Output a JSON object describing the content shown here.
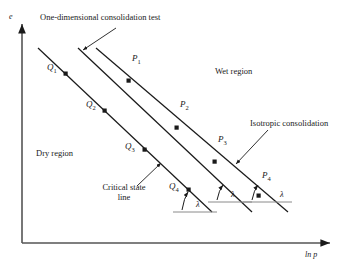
{
  "figure": {
    "type": "technical-diagram",
    "background": "#ffffff",
    "ink": "#1a1a1a"
  },
  "axes": {
    "y_label": "e",
    "x_label": "ln p",
    "origin": [
      22,
      243
    ],
    "y_top": [
      22,
      22
    ],
    "x_right": [
      332,
      243
    ],
    "arrowheads": "both"
  },
  "annotations": {
    "one_dim": "One-dimensional consolidation test",
    "isotropic": "Isotropic consolidation",
    "critical_state_line_1": "Critical state",
    "critical_state_line_2": "line",
    "wet_region": "Wet region",
    "dry_region": "Dry region"
  },
  "slope_symbols": [
    {
      "name": "lambda-1",
      "label": "λ"
    },
    {
      "name": "lambda-2",
      "label": "λ"
    },
    {
      "name": "lambda-3",
      "label": "λ"
    }
  ],
  "lines": [
    {
      "name": "critical-state-line",
      "x1": 38,
      "y1": 48,
      "x2": 212,
      "y2": 212
    },
    {
      "name": "one-dimensional-consolidation-line",
      "x1": 78,
      "y1": 48,
      "x2": 252,
      "y2": 212
    },
    {
      "name": "isotropic-consolidation-line",
      "x1": 96,
      "y1": 48,
      "x2": 288,
      "y2": 212
    }
  ],
  "points": [
    {
      "name": "Q1",
      "label": "Q",
      "sub": "1",
      "x": 66,
      "y": 74,
      "lx": 47,
      "ly": 68
    },
    {
      "name": "Q2",
      "label": "Q",
      "sub": "2",
      "x": 105,
      "y": 111,
      "lx": 86,
      "ly": 105
    },
    {
      "name": "Q3",
      "label": "Q",
      "sub": "3",
      "x": 145,
      "y": 150,
      "lx": 125,
      "ly": 147
    },
    {
      "name": "Q4",
      "label": "Q",
      "sub": "4",
      "x": 189,
      "y": 190,
      "lx": 170,
      "ly": 186
    },
    {
      "name": "P1",
      "label": "P",
      "sub": "1",
      "x": 129,
      "y": 81,
      "lx": 133,
      "ly": 58
    },
    {
      "name": "P2",
      "label": "P",
      "sub": "2",
      "x": 177,
      "y": 128,
      "lx": 181,
      "ly": 104
    },
    {
      "name": "P3",
      "label": "P",
      "sub": "3",
      "x": 215,
      "y": 162,
      "lx": 219,
      "ly": 139
    },
    {
      "name": "P4",
      "label": "P",
      "sub": "4",
      "x": 259,
      "y": 196,
      "lx": 263,
      "ly": 175
    }
  ],
  "lambda_markers": [
    {
      "name": "lambda-marker-left",
      "apex_x": 189,
      "apex_y": 190,
      "base_y": 212,
      "base_x1": 173,
      "base_x2": 217,
      "label_x": 199,
      "label_y": 202
    },
    {
      "name": "lambda-marker-middle",
      "apex_x": 224,
      "apex_y": 183,
      "base_y": 202,
      "base_x1": 208,
      "base_x2": 252,
      "label_x": 233,
      "label_y": 192
    },
    {
      "name": "lambda-marker-right",
      "apex_x": 259,
      "apex_y": 196,
      "base_y": 202,
      "base_x1": 243,
      "base_x2": 292,
      "label_x": 281,
      "label_y": 192
    }
  ],
  "leaders": [
    {
      "name": "one-dim-leader",
      "from": [
        116,
        28
      ],
      "to": [
        82,
        50
      ]
    },
    {
      "name": "isotropic-leader",
      "from": [
        266,
        130
      ],
      "to": [
        235,
        164
      ]
    },
    {
      "name": "critical-state-leader",
      "from": [
        138,
        186
      ],
      "to": [
        162,
        163
      ]
    }
  ]
}
